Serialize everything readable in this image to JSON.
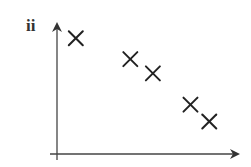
{
  "panel": {
    "label": "ii"
  },
  "chart_data": {
    "type": "scatter",
    "title": "",
    "panel_label": "ii",
    "xlabel": "",
    "ylabel": "",
    "marker": "x",
    "grid": false,
    "legend": null,
    "axes": {
      "x_ticks": [],
      "y_ticks": [],
      "arrows": true
    },
    "xlim": [
      0,
      10
    ],
    "ylim": [
      0,
      10
    ],
    "x": [
      1.0,
      3.9,
      5.1,
      7.1,
      8.1
    ],
    "y": [
      8.9,
      7.3,
      6.2,
      3.8,
      2.5
    ],
    "note": "Unlabeled axes; values estimated in relative units showing a negative correlation",
    "colors": {
      "axis": "#333333",
      "marker": "#222222"
    }
  }
}
